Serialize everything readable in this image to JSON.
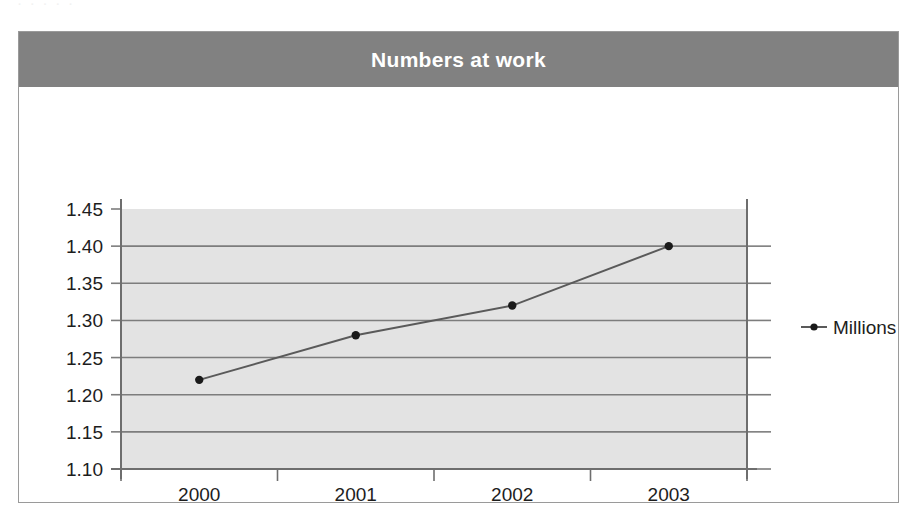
{
  "page": {
    "top_fragment": "· ·   · · ·"
  },
  "card": {
    "title": "Numbers at work"
  },
  "legend": {
    "position": "right",
    "entries": [
      {
        "label": "Millions",
        "marker": "line-with-dot-marker"
      }
    ]
  },
  "colors": {
    "title_banner": "#818181",
    "title_text": "#ffffff",
    "card_border": "#9a9a9a",
    "plot_background": "#e3e3e3",
    "gridline": "#7d7d7d",
    "axis_line": "#6e6e6e",
    "series_line": "#5a5a5a",
    "marker": "#1a1a1a",
    "tick_text": "#1d1d1d"
  },
  "chart_data": {
    "type": "line",
    "title": "Numbers at work",
    "xlabel": "",
    "ylabel": "",
    "categories": [
      "2000",
      "2001",
      "2002",
      "2003"
    ],
    "series": [
      {
        "name": "Millions",
        "values": [
          1.22,
          1.28,
          1.32,
          1.4
        ]
      }
    ],
    "ylim": [
      1.1,
      1.45
    ],
    "ytick_labels": [
      "1.45",
      "1.40",
      "1.35",
      "1.30",
      "1.25",
      "1.20",
      "1.15",
      "1.10"
    ],
    "ytick_values": [
      1.45,
      1.4,
      1.35,
      1.3,
      1.25,
      1.2,
      1.15,
      1.1
    ],
    "ytick_step": 0.05,
    "grid": true,
    "grid_axis": "y",
    "legend_position": "right",
    "marker_style": "filled-circle"
  }
}
